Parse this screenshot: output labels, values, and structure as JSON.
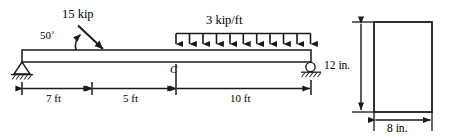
{
  "figure": {
    "kind": "beam-loading-diagram-with-cross-section",
    "colors": {
      "line": "#1a1a1a",
      "text": "#000000",
      "background": "#ffffff",
      "hatch": "#333333"
    },
    "beam": {
      "supports": [
        {
          "type": "pin",
          "position_label": "A",
          "x_ft": 0
        },
        {
          "type": "roller",
          "position_label": "B",
          "x_ft": 22
        }
      ],
      "total_length_ft": 22
    },
    "loads": {
      "point_load": {
        "magnitude": "15 kip",
        "angle": "50",
        "angle_label": "50˚",
        "direction": "down-right",
        "applied_at_ft": 7
      },
      "distributed_load": {
        "magnitude": "3 kip/ft",
        "start_ft": 12,
        "end_ft": 22,
        "arrow_count": 11,
        "direction": "down"
      }
    },
    "points": {
      "interior_label": "C",
      "interior_position_ft": 12
    },
    "dimensions": [
      {
        "label": "7 ft",
        "from_ft": 0,
        "to_ft": 7
      },
      {
        "label": "5 ft",
        "from_ft": 7,
        "to_ft": 12
      },
      {
        "label": "10 ft",
        "from_ft": 12,
        "to_ft": 22
      }
    ],
    "cross_section": {
      "shape": "rectangle",
      "height_label": "12 in.",
      "width_label": "8 in.",
      "height_in": 12,
      "width_in": 8
    }
  }
}
